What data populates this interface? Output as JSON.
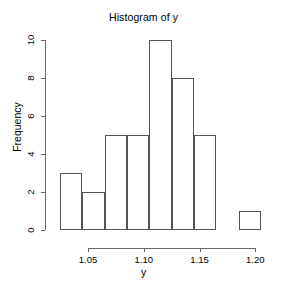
{
  "chart_data": {
    "type": "bar",
    "title": "Histogram of y",
    "xlabel": "y",
    "ylabel": "Frequency",
    "xlim": [
      1.02,
      1.205
    ],
    "ylim": [
      0,
      10
    ],
    "grid": false,
    "legend": null,
    "bin_width": 0.02,
    "bin_edges": [
      1.025,
      1.045,
      1.065,
      1.085,
      1.105,
      1.125,
      1.145,
      1.165,
      1.185,
      1.205
    ],
    "categories": [
      "1.025-1.045",
      "1.045-1.065",
      "1.065-1.085",
      "1.085-1.105",
      "1.105-1.125",
      "1.125-1.145",
      "1.145-1.165",
      "1.165-1.185",
      "1.185-1.205"
    ],
    "values": [
      3,
      2,
      5,
      5,
      10,
      8,
      5,
      0,
      1
    ],
    "bars": [
      {
        "label": "bin-1",
        "x0": 1.025,
        "x1": 1.045,
        "value": 3
      },
      {
        "label": "bin-2",
        "x0": 1.045,
        "x1": 1.065,
        "value": 2
      },
      {
        "label": "bin-3",
        "x0": 1.065,
        "x1": 1.085,
        "value": 5
      },
      {
        "label": "bin-4",
        "x0": 1.085,
        "x1": 1.105,
        "value": 5
      },
      {
        "label": "bin-5",
        "x0": 1.105,
        "x1": 1.125,
        "value": 10
      },
      {
        "label": "bin-6",
        "x0": 1.125,
        "x1": 1.145,
        "value": 8
      },
      {
        "label": "bin-7",
        "x0": 1.145,
        "x1": 1.165,
        "value": 5
      },
      {
        "label": "bin-8",
        "x0": 1.165,
        "x1": 1.185,
        "value": 0
      },
      {
        "label": "bin-9",
        "x0": 1.185,
        "x1": 1.205,
        "value": 1
      }
    ],
    "y_ticks": [
      0,
      2,
      4,
      6,
      8,
      10
    ],
    "y_tick_labels": [
      "0",
      "2",
      "4",
      "6",
      "8",
      "10"
    ],
    "x_ticks": [
      1.05,
      1.1,
      1.15,
      1.2
    ],
    "x_tick_labels": [
      "1.05",
      "1.10",
      "1.15",
      "1.20"
    ],
    "colors": {
      "bar_border": "#555555",
      "bar_fill": "transparent",
      "axis": "#666666",
      "text": "#000000",
      "background": "#ffffff"
    }
  }
}
